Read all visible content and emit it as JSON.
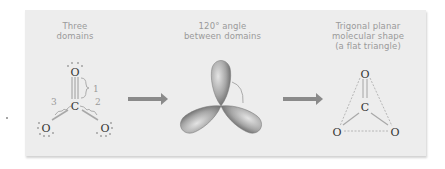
{
  "panels": [
    {
      "id": "electron-domains",
      "caption_lines": [
        "Three",
        "domains"
      ],
      "molecule": {
        "central_atom": "C",
        "outer_atoms": [
          "O",
          "O",
          "O"
        ],
        "domain_labels": [
          "1",
          "2",
          "3"
        ]
      }
    },
    {
      "id": "orbital-geometry",
      "caption_lines": [
        "120° angle",
        "between domains"
      ]
    },
    {
      "id": "molecular-shape",
      "caption_lines": [
        "Trigonal planar",
        "molecular shape",
        "(a flat triangle)"
      ],
      "molecule": {
        "central_atom": "C",
        "outer_atoms": [
          "O",
          "O",
          "O"
        ]
      }
    }
  ],
  "colors": {
    "panel_bg": "#ededed",
    "caption": "#9a9a9a",
    "arrow": "#8a8a8a",
    "atom": "#333333",
    "lone_pair": "#999999",
    "bond": "#a8a8a8",
    "orbital_light": "#d8d8d8",
    "orbital_dark": "#6a6a6a"
  }
}
